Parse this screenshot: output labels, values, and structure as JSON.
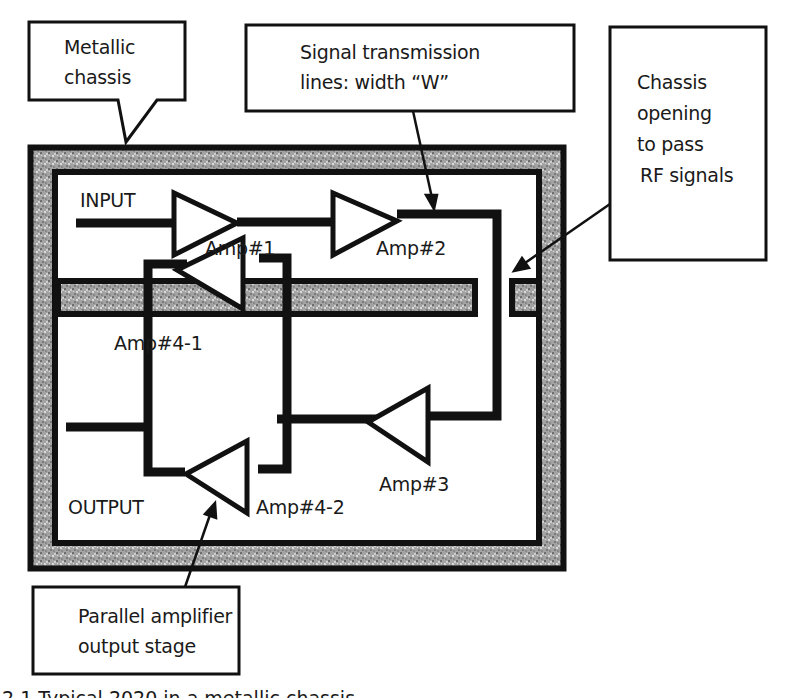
{
  "diagram": {
    "colors": {
      "line": "#111111",
      "metal_fill": "#9a9a9a",
      "background": "#ffffff"
    },
    "callouts": {
      "metallic_chassis": {
        "line1": "Metallic",
        "line2": "chassis"
      },
      "transmission_lines": {
        "line1": "Signal transmission",
        "line2": "lines: width “W”"
      },
      "chassis_opening": {
        "line1": "Chassis",
        "line2": "opening",
        "line3": "to pass",
        "line4": "RF signals"
      },
      "parallel_stage": {
        "line1": "Parallel amplifier",
        "line2": "output stage"
      }
    },
    "labels": {
      "input": "INPUT",
      "output": "OUTPUT",
      "amp1": "Amp#1",
      "amp2": "Amp#2",
      "amp3": "Amp#3",
      "amp4_1": "Amp#4-1",
      "amp4_2": "Amp#4-2"
    },
    "caption": "2.1   Typical 2020 in a metallic chassis"
  }
}
